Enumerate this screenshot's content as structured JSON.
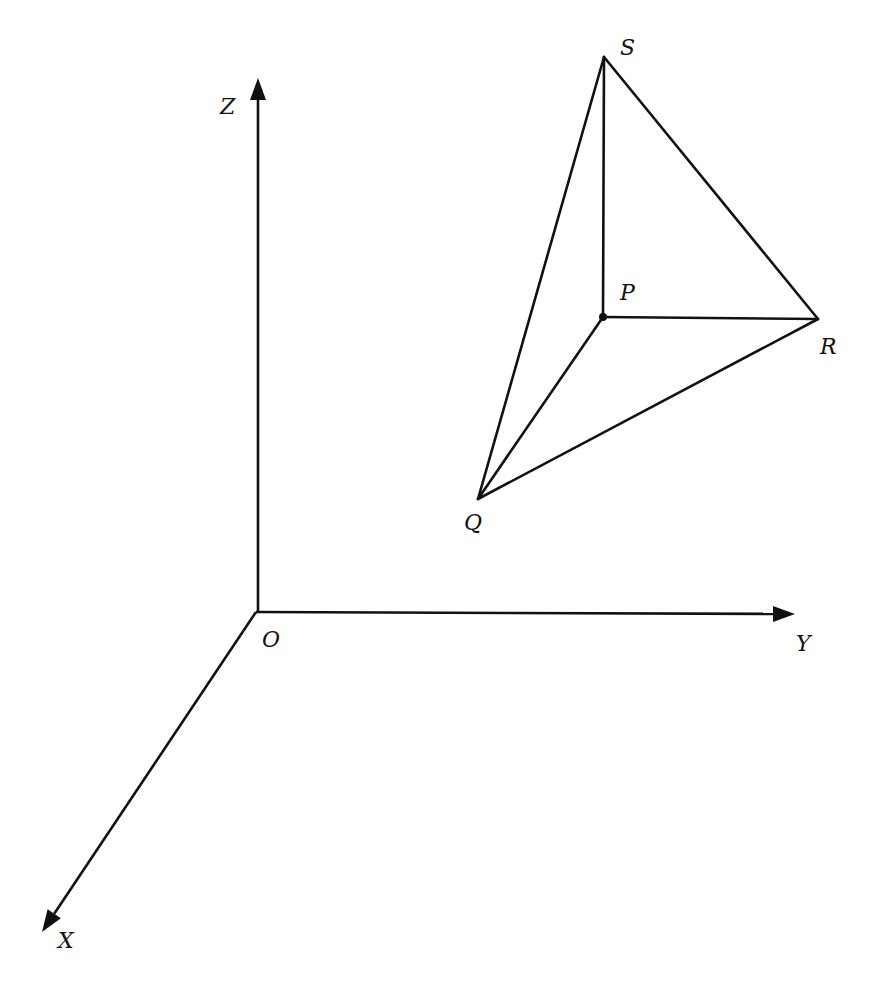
{
  "diagram": {
    "type": "3d-coordinate-tetrahedron",
    "colors": {
      "stroke": "#111111",
      "background": "#ffffff"
    },
    "axes": [
      {
        "name": "z-axis",
        "label": "Z",
        "from": [
          258,
          612
        ],
        "to": [
          258,
          78
        ],
        "label_pos": [
          220,
          114
        ]
      },
      {
        "name": "y-axis",
        "label": "Y",
        "from": [
          256,
          612
        ],
        "to": [
          795,
          614
        ],
        "label_pos": [
          796,
          651
        ]
      },
      {
        "name": "x-axis",
        "label": "X",
        "from": [
          256,
          612
        ],
        "to": [
          42,
          932
        ],
        "label_pos": [
          58,
          948
        ]
      }
    ],
    "origin": {
      "label": "O",
      "point": [
        256,
        612
      ],
      "label_pos": [
        262,
        647
      ]
    },
    "vertices": {
      "S": {
        "label": "S",
        "point": [
          604,
          57
        ],
        "label_pos": [
          620,
          55
        ]
      },
      "P": {
        "label": "P",
        "point": [
          603,
          317
        ],
        "label_pos": [
          620,
          300
        ]
      },
      "R": {
        "label": "R",
        "point": [
          818,
          319
        ],
        "label_pos": [
          820,
          354
        ]
      },
      "Q": {
        "label": "Q",
        "point": [
          478,
          499
        ],
        "label_pos": [
          464,
          530
        ]
      }
    },
    "edges": [
      [
        "S",
        "P"
      ],
      [
        "S",
        "R"
      ],
      [
        "S",
        "Q"
      ],
      [
        "P",
        "R"
      ],
      [
        "P",
        "Q"
      ],
      [
        "Q",
        "R"
      ]
    ]
  }
}
